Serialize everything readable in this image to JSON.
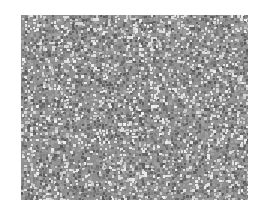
{
  "image": {
    "description": "Grayscale micrograph-like cellular/porous texture",
    "region": {
      "x": 21,
      "y": 15,
      "width": 227,
      "height": 185
    },
    "colors": {
      "background": "#ffffff",
      "base": "#8f8f8f",
      "dark": "#5a5a5a",
      "light": "#e0e0e0"
    }
  }
}
